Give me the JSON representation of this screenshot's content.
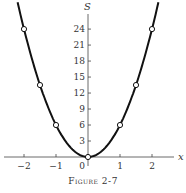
{
  "caption": "Figure 2-7",
  "chart_data": {
    "type": "line",
    "title": "",
    "xlabel": "x",
    "ylabel": "S",
    "x_ticks": [
      -2,
      -1,
      0,
      1,
      2
    ],
    "y_ticks": [
      3,
      6,
      9,
      12,
      15,
      18,
      21,
      24
    ],
    "xlim": [
      -2.5,
      2.5
    ],
    "ylim": [
      0,
      27
    ],
    "grid": false,
    "series": [
      {
        "name": "S = 6x^2",
        "x": [
          -2,
          -1.5,
          -1,
          0,
          1,
          1.5,
          2
        ],
        "values": [
          24,
          13.5,
          6,
          0,
          6,
          13.5,
          24
        ]
      }
    ]
  }
}
